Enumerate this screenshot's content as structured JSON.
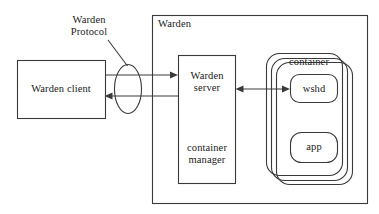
{
  "diagram": {
    "type": "block-diagram",
    "colors": {
      "stroke": "#3a3a3a",
      "text": "#1a1a1a",
      "background": "#ffffff"
    },
    "nodes": {
      "warden_client": {
        "label": "Warden client",
        "shape": "rectangle"
      },
      "warden_boundary": {
        "label": "Warden",
        "shape": "rectangle"
      },
      "warden_server": {
        "label": "Warden\nserver",
        "shape": "rectangle"
      },
      "container_manager": {
        "label": "container\nmanager",
        "shape": "rectangle-section"
      },
      "container": {
        "label": "container",
        "shape": "rounded-rectangle-stack"
      },
      "wshd": {
        "label": "wshd",
        "shape": "rounded-rectangle"
      },
      "app": {
        "label": "app",
        "shape": "rounded-rectangle"
      },
      "protocol": {
        "label": "Warden\nProtocol",
        "shape": "ellipse-annotation"
      }
    },
    "edges": [
      {
        "from": "warden_client",
        "to": "warden_server",
        "style": "arrow-right"
      },
      {
        "from": "warden_server",
        "to": "warden_client",
        "style": "arrow-left"
      },
      {
        "from": "warden_server",
        "to": "wshd",
        "style": "arrow-both"
      }
    ]
  }
}
